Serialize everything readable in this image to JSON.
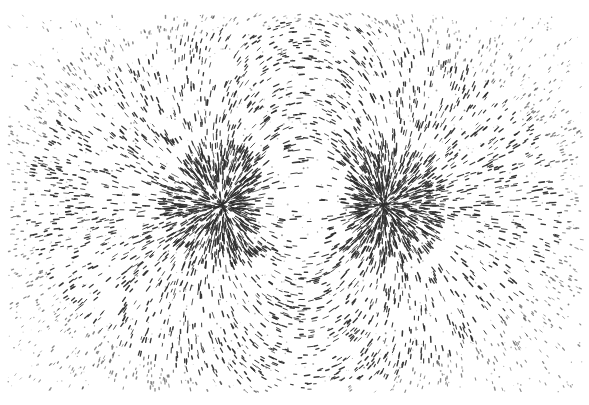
{
  "image": {
    "subject": "Iron filings aligned along the magnetic field lines of a bar magnet",
    "background_color": "#ffffff",
    "filing_color": "#2e2e2e",
    "width": 589,
    "height": 405
  },
  "field": {
    "poles": [
      {
        "name": "left-pole",
        "x": 222,
        "y": 205,
        "charge": 1
      },
      {
        "name": "right-pole",
        "x": 384,
        "y": 205,
        "charge": -1
      }
    ],
    "region": {
      "x0": 8,
      "y0": 14,
      "x1": 582,
      "y1": 392
    },
    "dense_radius": 48,
    "filing_count": 5200,
    "seed": 7
  }
}
